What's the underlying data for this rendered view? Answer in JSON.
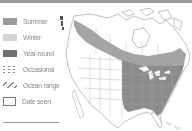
{
  "legend": {
    "items": [
      {
        "key": "summer",
        "label": "Summer",
        "color": "#9a9a9a"
      },
      {
        "key": "winter",
        "label": "Winter",
        "color": "#d4d4d4"
      },
      {
        "key": "yearround",
        "label": "Year-round",
        "color": "#6e6e6e"
      },
      {
        "key": "occasional",
        "label": "Occasional",
        "pattern": "dotted"
      },
      {
        "key": "ocean",
        "label": "Ocean range",
        "pattern": "hatched"
      },
      {
        "key": "dateseen",
        "label": "Date seen",
        "pattern": "outline"
      }
    ]
  },
  "map": {
    "region": "North America",
    "colors": {
      "land": "#ffffff",
      "outline": "#9a9a9a",
      "summer": "#a4a4a4",
      "yearround": "#8c8c8c",
      "water": "#ffffff"
    }
  },
  "colors": {
    "top_bar": "#9a9a9a",
    "legend_text": "#8a8a8a"
  }
}
